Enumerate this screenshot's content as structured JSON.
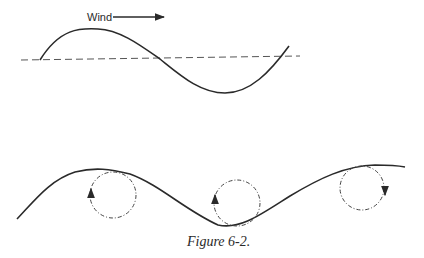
{
  "top_diagram": {
    "wind_label": "Wind",
    "description": "Sinusoidal wave with dashed horizontal mean line; wind arrow pointing right"
  },
  "bottom_diagram": {
    "description": "Wave surface with three dashed circular orbits; arrows show circulation direction",
    "orbits": [
      {
        "position": "crest",
        "direction": "counterclockwise-up-left"
      },
      {
        "position": "trough",
        "direction": "counterclockwise-up-left"
      },
      {
        "position": "crest",
        "direction": "clockwise-down-right"
      }
    ]
  },
  "caption": "Figure 6-2."
}
